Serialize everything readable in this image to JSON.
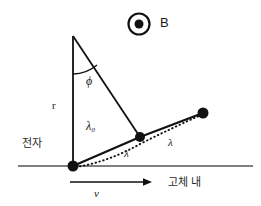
{
  "figure": {
    "background_color": "#ffffff",
    "line_color": "#111111",
    "axis_color": "#555555"
  },
  "labels": {
    "magnetic_field": "B",
    "angle": "ϕ",
    "radius": "r",
    "lambda_zero": "λ₀",
    "lambda_first": "λ",
    "lambda_second": "λ",
    "electron": "전자",
    "inside_solid": "고체 내",
    "velocity": "v"
  },
  "geometry": {
    "baseline": {
      "x1": 18,
      "y1": 166,
      "x2": 253,
      "y2": 166
    },
    "vertical_line": {
      "x1": 73,
      "y1": 36,
      "x2": 73,
      "y2": 166
    },
    "diagonal_line": {
      "x1": 73,
      "y1": 36,
      "x2": 140,
      "y2": 137
    },
    "angle_arc": {
      "cx": 73,
      "cy": 36,
      "radius": 38,
      "from": "vertical",
      "to": "diagonal"
    },
    "nodes": [
      {
        "name": "electron-origin",
        "x": 73,
        "y": 166,
        "r": 5.5
      },
      {
        "name": "scatter-point-1",
        "x": 140,
        "y": 137,
        "r": 5.0
      },
      {
        "name": "scatter-point-2",
        "x": 203,
        "y": 113,
        "r": 5.5
      }
    ],
    "solid_path": [
      [
        73,
        166
      ],
      [
        140,
        137
      ],
      [
        203,
        113
      ]
    ],
    "dotted_curve": "M 76 167 Q 108 162 140 144 Q 172 128 201 115",
    "velocity_arrow": {
      "x1": 70,
      "y1": 182,
      "x2": 148,
      "y2": 182
    },
    "field_symbol": {
      "cx": 139,
      "cy": 24,
      "outer_r": 10.5,
      "inner_r": 4.5
    }
  }
}
